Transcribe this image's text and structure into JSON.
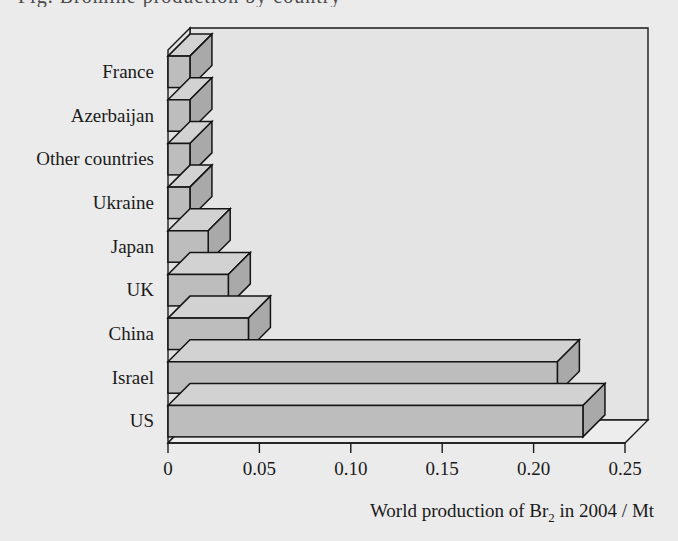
{
  "chart_data": {
    "type": "bar",
    "orientation": "horizontal",
    "style": "3d-bar",
    "title": "",
    "subtitle": "",
    "xlabel": "World production of Br2 in 2004 / Mt",
    "xlabel_parts": {
      "before": "World production of Br",
      "subscript": "2",
      "after": " in 2004 / Mt"
    },
    "ylabel": "",
    "categories": [
      "France",
      "Azerbaijan",
      "Other countries",
      "Ukraine",
      "Japan",
      "UK",
      "China",
      "Israel",
      "US"
    ],
    "values": [
      0.012,
      0.012,
      0.012,
      0.012,
      0.022,
      0.033,
      0.044,
      0.213,
      0.227
    ],
    "xlim": [
      0,
      0.25
    ],
    "xticks": [
      0,
      0.05,
      0.1,
      0.15,
      0.2,
      0.25
    ],
    "xticklabels": [
      "0",
      "0.05",
      "0.10",
      "0.15",
      "0.20",
      "0.25"
    ],
    "grid": false,
    "legend": null,
    "colors": {
      "bar_front": "#bdbdbd",
      "bar_top": "#d2d2d2",
      "bar_side": "#a9a9a9",
      "outline": "#141414",
      "background": "#ebebeb",
      "floor": "#ededed",
      "back_wall": "#e4e4e4"
    }
  },
  "figure": {
    "cropped_header_text": "Fig. Bromine production by country",
    "axis_title": "World production of Br in 2004 / Mt",
    "axis_title_subscript": "2"
  }
}
